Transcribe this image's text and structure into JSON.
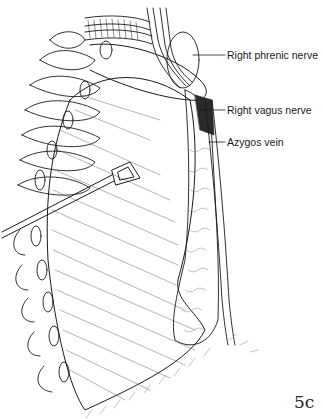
{
  "figure": {
    "number": "5c",
    "labels": [
      {
        "text": "Right phrenic nerve",
        "x": 227,
        "y": 49
      },
      {
        "text": "Right vagus nerve",
        "x": 227,
        "y": 104
      },
      {
        "text": "Azygos vein",
        "x": 227,
        "y": 136
      }
    ],
    "colors": {
      "ink": "#1a1a1a",
      "background": "#ffffff"
    }
  }
}
